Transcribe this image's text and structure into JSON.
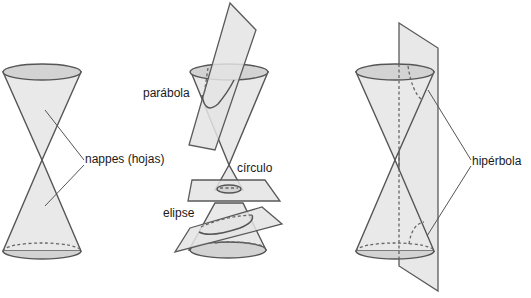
{
  "diagram": {
    "type": "conic-sections",
    "background": "#ffffff",
    "stroke_color": "#555555",
    "fill_color": "#e9e9e9",
    "rim_color": "#d3d3d3",
    "panels": [
      {
        "id": "double-cone",
        "labels": {
          "nappes": "nappes (hojas)"
        }
      },
      {
        "id": "sections",
        "labels": {
          "parabola": "parábola",
          "circle": "círculo",
          "ellipse": "elipse"
        }
      },
      {
        "id": "hyperbola",
        "labels": {
          "hyperbola": "hipérbola"
        }
      }
    ]
  }
}
